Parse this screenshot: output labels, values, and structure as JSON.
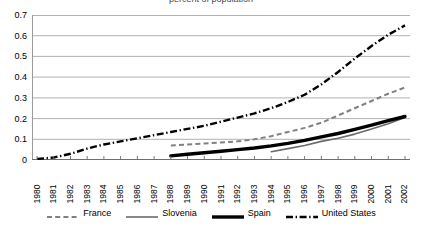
{
  "title_clipped": "percent of population",
  "chart_data": {
    "type": "line",
    "title": "",
    "xlabel": "",
    "ylabel": "",
    "ylim": [
      0,
      0.7
    ],
    "yticks": [
      "0",
      "0.1",
      "0.2",
      "0.3",
      "0.4",
      "0.5",
      "0.6",
      "0.7"
    ],
    "ytick_values": [
      0,
      0.1,
      0.2,
      0.3,
      0.4,
      0.5,
      0.6,
      0.7
    ],
    "grid": "horizontal",
    "legend_position": "bottom",
    "categories": [
      "1980",
      "1981",
      "1982",
      "1983",
      "1984",
      "1985",
      "1986",
      "1987",
      "1988",
      "1989",
      "1990",
      "1991",
      "1992",
      "1993",
      "1994",
      "1995",
      "1996",
      "1997",
      "1998",
      "1999",
      "2000",
      "2001",
      "2002"
    ],
    "series": [
      {
        "name": "France",
        "style": "dashed",
        "color": "#808080",
        "values": [
          null,
          null,
          null,
          null,
          null,
          null,
          null,
          null,
          0.07,
          0.075,
          0.08,
          0.085,
          0.09,
          0.1,
          0.115,
          0.135,
          0.155,
          0.18,
          0.215,
          0.25,
          0.285,
          0.32,
          0.35
        ]
      },
      {
        "name": "Slovenia",
        "style": "solid-thin",
        "color": "#6b6b6b",
        "values": [
          null,
          null,
          null,
          null,
          null,
          null,
          null,
          null,
          null,
          null,
          null,
          null,
          null,
          null,
          0.04,
          0.055,
          0.07,
          0.09,
          0.105,
          0.125,
          0.15,
          0.175,
          0.205
        ]
      },
      {
        "name": "Spain",
        "style": "solid-thick",
        "color": "#000000",
        "values": [
          null,
          null,
          null,
          null,
          null,
          null,
          null,
          null,
          0.02,
          0.028,
          0.035,
          0.042,
          0.05,
          0.058,
          0.068,
          0.08,
          0.095,
          0.112,
          0.128,
          0.148,
          0.168,
          0.19,
          0.21
        ]
      },
      {
        "name": "United States",
        "style": "dash-dot",
        "color": "#000000",
        "values": [
          0.005,
          0.012,
          0.03,
          0.055,
          0.075,
          0.09,
          0.105,
          0.12,
          0.135,
          0.15,
          0.165,
          0.185,
          0.205,
          0.225,
          0.25,
          0.28,
          0.315,
          0.365,
          0.425,
          0.49,
          0.55,
          0.605,
          0.65
        ]
      }
    ]
  },
  "legend": {
    "items": [
      {
        "label": "France"
      },
      {
        "label": "Slovenia"
      },
      {
        "label": "Spain"
      },
      {
        "label": "United States"
      }
    ]
  }
}
